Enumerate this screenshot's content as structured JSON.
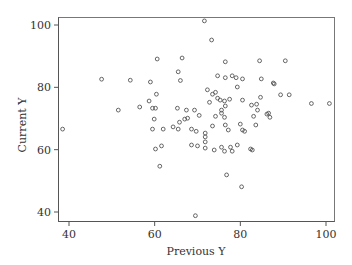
{
  "chart_data": {
    "type": "scatter",
    "title": "",
    "xlabel": "Previous Y",
    "ylabel": "Current Y",
    "xlim": [
      37.5,
      102.5
    ],
    "ylim": [
      37.5,
      102.5
    ],
    "xticks": [
      40,
      60,
      80,
      100
    ],
    "yticks": [
      40,
      60,
      80,
      100
    ],
    "grid": false,
    "legend": null,
    "marker": "open-circle",
    "points": [
      [
        38.5,
        66.6
      ],
      [
        47.6,
        82.6
      ],
      [
        54.3,
        82.3
      ],
      [
        59.0,
        81.7
      ],
      [
        60.4,
        77.8
      ],
      [
        59.5,
        73.3
      ],
      [
        60.2,
        73.3
      ],
      [
        59.9,
        69.8
      ],
      [
        59.5,
        66.6
      ],
      [
        60.2,
        60.2
      ],
      [
        61.6,
        61.2
      ],
      [
        61.2,
        54.7
      ],
      [
        51.5,
        72.7
      ],
      [
        60.6,
        89.1
      ],
      [
        65.5,
        85.0
      ],
      [
        66.0,
        82.2
      ],
      [
        66.4,
        89.4
      ],
      [
        65.3,
        73.3
      ],
      [
        65.8,
        68.8
      ],
      [
        67.4,
        72.7
      ],
      [
        69.3,
        72.7
      ],
      [
        70.4,
        71.0
      ],
      [
        67.0,
        69.8
      ],
      [
        67.7,
        70.1
      ],
      [
        68.6,
        66.6
      ],
      [
        69.7,
        65.9
      ],
      [
        68.6,
        61.5
      ],
      [
        70.0,
        61.2
      ],
      [
        71.8,
        60.5
      ],
      [
        71.8,
        62.5
      ],
      [
        71.8,
        64.1
      ],
      [
        71.8,
        65.3
      ],
      [
        72.8,
        75.2
      ],
      [
        74.7,
        76.5
      ],
      [
        74.2,
        70.7
      ],
      [
        75.6,
        71.7
      ],
      [
        72.3,
        79.2
      ],
      [
        73.5,
        77.8
      ],
      [
        74.2,
        78.4
      ],
      [
        75.3,
        75.9
      ],
      [
        76.3,
        75.6
      ],
      [
        76.5,
        88.2
      ],
      [
        76.5,
        83.1
      ],
      [
        74.7,
        83.7
      ],
      [
        77.5,
        76.2
      ],
      [
        76.5,
        74.0
      ],
      [
        76.3,
        70.4
      ],
      [
        76.5,
        67.9
      ],
      [
        77.2,
        66.3
      ],
      [
        73.5,
        67.6
      ],
      [
        73.9,
        59.9
      ],
      [
        75.6,
        60.8
      ],
      [
        76.3,
        59.5
      ],
      [
        78.1,
        59.5
      ],
      [
        79.3,
        61.5
      ],
      [
        77.7,
        60.8
      ],
      [
        75.6,
        72.7
      ],
      [
        79.3,
        80.1
      ],
      [
        80.5,
        75.9
      ],
      [
        82.6,
        74.3
      ],
      [
        83.8,
        74.6
      ],
      [
        84.7,
        76.8
      ],
      [
        84.0,
        72.7
      ],
      [
        86.2,
        71.4
      ],
      [
        86.6,
        71.7
      ],
      [
        83.1,
        70.7
      ],
      [
        86.9,
        70.4
      ],
      [
        83.6,
        67.9
      ],
      [
        82.4,
        60.2
      ],
      [
        82.8,
        59.9
      ],
      [
        80.0,
        68.2
      ],
      [
        80.5,
        66.3
      ],
      [
        81.0,
        65.9
      ],
      [
        87.7,
        81.4
      ],
      [
        89.4,
        77.6
      ],
      [
        91.4,
        77.6
      ],
      [
        84.5,
        88.5
      ],
      [
        90.5,
        88.5
      ],
      [
        87.9,
        81.1
      ],
      [
        84.9,
        82.7
      ],
      [
        79.0,
        83.1
      ],
      [
        78.1,
        83.7
      ],
      [
        80.5,
        82.7
      ],
      [
        71.6,
        101.3
      ],
      [
        73.3,
        95.2
      ],
      [
        96.6,
        74.8
      ],
      [
        100.8,
        74.8
      ],
      [
        76.8,
        51.9
      ],
      [
        80.3,
        48.1
      ],
      [
        69.5,
        38.8
      ],
      [
        62.0,
        66.6
      ],
      [
        64.3,
        67.3
      ],
      [
        65.5,
        66.6
      ],
      [
        56.5,
        73.7
      ],
      [
        58.7,
        75.6
      ]
    ]
  },
  "axes": {
    "x_title": "Previous Y",
    "y_title": "Current Y",
    "x_tick_labels": [
      "40",
      "60",
      "80",
      "100"
    ],
    "y_tick_labels": [
      "40",
      "60",
      "80",
      "100"
    ]
  }
}
